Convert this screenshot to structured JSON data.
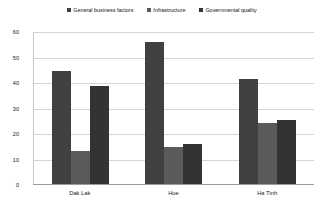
{
  "chart_data": {
    "type": "bar",
    "title": "",
    "xlabel": "",
    "ylabel": "",
    "categories": [
      "Dak Lak",
      "Hue",
      "Ha Tinh"
    ],
    "series": [
      {
        "name": "General business factors",
        "color": "#404040",
        "values": [
          44.5,
          55.5,
          41
        ]
      },
      {
        "name": "Infrastructure",
        "color": "#5b5b5b",
        "values": [
          13,
          14.5,
          24
        ]
      },
      {
        "name": "Governmental quality",
        "color": "#333333",
        "values": [
          38.5,
          15.5,
          25
        ]
      }
    ],
    "ylim": [
      0,
      60
    ],
    "yticks": [
      0,
      10,
      20,
      30,
      40,
      50,
      60
    ],
    "ytick_labels": [
      "0",
      "10",
      "20",
      "30",
      "40",
      "50",
      "60"
    ],
    "grid": true,
    "legend_position": "top-center"
  },
  "legend": {
    "items": [
      {
        "label": "General business factors",
        "marker": "square-marker"
      },
      {
        "label": "Infrastructure",
        "marker": "square-marker"
      },
      {
        "label": "Governmental quality",
        "marker": "square-marker"
      }
    ]
  }
}
